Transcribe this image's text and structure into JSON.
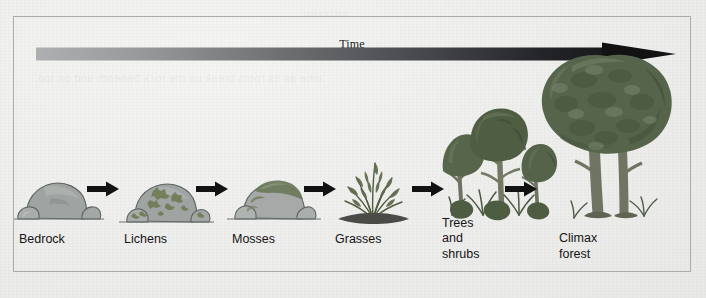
{
  "figure": {
    "type": "primary-ecological-succession-diagram",
    "time_axis": {
      "label": "Time",
      "direction": "left-to-right",
      "gradient_from": "#a6a8aa",
      "gradient_to": "#161616",
      "arrowhead_color": "#111111"
    },
    "bleed_through": {
      "line1": "time as its roots break up the rock beneath and on top.",
      "line2": "succession"
    },
    "connector": {
      "icon": "right-arrow-icon",
      "color": "#121212",
      "count": 5
    },
    "frame": {
      "border_color": "#a9acae",
      "background": "#efefed"
    },
    "stages": [
      {
        "id": "bedrock",
        "label": "Bedrock",
        "art": "bare-boulder-icon",
        "lines": 1,
        "colors": {
          "rock": "#9a9e9d",
          "rock_shade": "#7e8483",
          "outline": "#5d6362"
        }
      },
      {
        "id": "lichens",
        "label": "Lichens",
        "art": "lichen-covered-rock-icon",
        "lines": 1,
        "colors": {
          "rock": "#9a9e9d",
          "rock_shade": "#7e8483",
          "lichen": "#6f7d55",
          "outline": "#5d6362"
        }
      },
      {
        "id": "mosses",
        "label": "Mosses",
        "art": "moss-covered-rock-icon",
        "lines": 1,
        "colors": {
          "rock": "#a3a6a4",
          "moss": "#6d7a5c",
          "outline": "#5d6362"
        }
      },
      {
        "id": "grasses",
        "label": "Grasses",
        "art": "grass-clump-icon",
        "lines": 1,
        "colors": {
          "foliage": "#5d6b4c",
          "foliage_light": "#79876a",
          "soil": "#4a4a46"
        }
      },
      {
        "id": "trees-and-shrubs",
        "label": "Trees and\nshrubs",
        "art": "young-trees-and-shrubs-icon",
        "lines": 2,
        "colors": {
          "canopy": "#57654a",
          "canopy_dark": "#44513a",
          "trunk": "#6d7360",
          "shrub": "#4e5c42"
        }
      },
      {
        "id": "climax-forest",
        "label": "Climax\nforest",
        "art": "mature-climax-tree-icon",
        "lines": 2,
        "colors": {
          "canopy": "#5b6950",
          "canopy_dark": "#46543e",
          "canopy_light": "#76836a",
          "trunk": "#6f7562"
        }
      }
    ]
  }
}
